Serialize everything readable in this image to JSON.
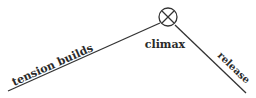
{
  "diagram": {
    "type": "plot-arc",
    "labels": {
      "rising": "tension builds",
      "peak": "climax",
      "falling": "release"
    },
    "peak_marker": "circled-x-icon",
    "colors": {
      "line": "#333333",
      "text": "#2a2a2a",
      "background": "#ffffff"
    }
  }
}
